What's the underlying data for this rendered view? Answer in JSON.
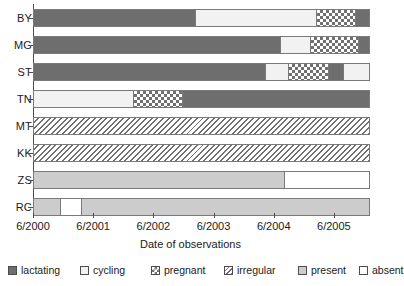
{
  "chart_data": {
    "type": "bar",
    "subtype": "horizontal-stacked-timeline",
    "title": "",
    "xlabel": "Date of observations",
    "ylabel": "",
    "grid": false,
    "legend_position": "bottom",
    "x_axis": {
      "tick_labels": [
        "6/2000",
        "6/2001",
        "6/2002",
        "6/2003",
        "6/2004",
        "6/2005"
      ],
      "tick_values": [
        2000.45,
        2001.45,
        2002.45,
        2003.45,
        2004.45,
        2005.45
      ],
      "range_start": 2000.45,
      "range_end": 2006.05
    },
    "categories": [
      "BY",
      "MG",
      "ST",
      "TN",
      "MT",
      "KK",
      "ZS",
      "RC"
    ],
    "states": [
      {
        "key": "lactating",
        "label": "lactating",
        "swatch": "fill-lactating",
        "color": "#6e6e6e"
      },
      {
        "key": "cycling",
        "label": "cycling",
        "swatch": "fill-cycling",
        "color": "#f2f2f2"
      },
      {
        "key": "pregnant",
        "label": "pregnant",
        "swatch": "fill-pregnant",
        "color": "#707070"
      },
      {
        "key": "irregular",
        "label": "irregular",
        "swatch": "fill-irregular",
        "color": "#707070"
      },
      {
        "key": "present",
        "label": "present",
        "swatch": "fill-present",
        "color": "#cccccc"
      },
      {
        "key": "absent",
        "label": "absent",
        "swatch": "fill-absent",
        "color": "#ffffff"
      }
    ],
    "series": [
      {
        "name": "BY",
        "segments": [
          {
            "state": "lactating",
            "start": 2000.45,
            "end": 2003.15
          },
          {
            "state": "cycling",
            "start": 2003.15,
            "end": 2005.15
          },
          {
            "state": "pregnant",
            "start": 2005.15,
            "end": 2005.8
          },
          {
            "state": "lactating",
            "start": 2005.8,
            "end": 2006.05
          }
        ]
      },
      {
        "name": "MG",
        "segments": [
          {
            "state": "lactating",
            "start": 2000.45,
            "end": 2004.56
          },
          {
            "state": "cycling",
            "start": 2004.56,
            "end": 2005.05
          },
          {
            "state": "pregnant",
            "start": 2005.05,
            "end": 2005.85
          },
          {
            "state": "lactating",
            "start": 2005.85,
            "end": 2006.05
          }
        ]
      },
      {
        "name": "ST",
        "segments": [
          {
            "state": "lactating",
            "start": 2000.45,
            "end": 2004.31
          },
          {
            "state": "cycling",
            "start": 2004.31,
            "end": 2004.68
          },
          {
            "state": "pregnant",
            "start": 2004.68,
            "end": 2005.35
          },
          {
            "state": "lactating",
            "start": 2005.35,
            "end": 2005.6
          },
          {
            "state": "cycling",
            "start": 2005.6,
            "end": 2006.05
          }
        ]
      },
      {
        "name": "TN",
        "segments": [
          {
            "state": "cycling",
            "start": 2000.45,
            "end": 2002.12
          },
          {
            "state": "pregnant",
            "start": 2002.12,
            "end": 2002.92
          },
          {
            "state": "lactating",
            "start": 2002.92,
            "end": 2006.05
          }
        ]
      },
      {
        "name": "MT",
        "segments": [
          {
            "state": "irregular",
            "start": 2000.45,
            "end": 2006.05
          }
        ]
      },
      {
        "name": "KK",
        "segments": [
          {
            "state": "irregular",
            "start": 2000.45,
            "end": 2006.05
          }
        ]
      },
      {
        "name": "ZS",
        "segments": [
          {
            "state": "present",
            "start": 2000.45,
            "end": 2004.62
          },
          {
            "state": "absent",
            "start": 2004.62,
            "end": 2006.05
          }
        ]
      },
      {
        "name": "RC",
        "segments": [
          {
            "state": "present",
            "start": 2000.45,
            "end": 2000.9
          },
          {
            "state": "absent",
            "start": 2000.9,
            "end": 2001.24
          },
          {
            "state": "present",
            "start": 2001.24,
            "end": 2006.05
          }
        ]
      }
    ]
  }
}
